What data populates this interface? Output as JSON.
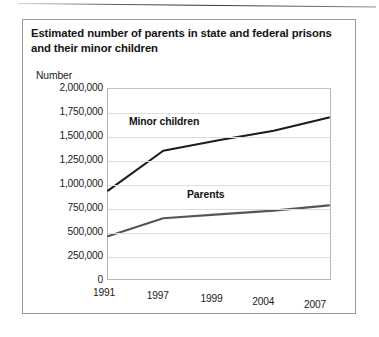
{
  "figure": {
    "title": "Estimated number of parents in state and federal prisons and their minor children"
  },
  "chart_data": {
    "type": "line",
    "title": "Estimated number of parents in state and federal prisons and their minor children",
    "xlabel": "",
    "ylabel": "Number",
    "ylim": [
      0,
      2000000
    ],
    "grid": true,
    "legend": "inline-labels",
    "categories": [
      "1991",
      "1997",
      "1999",
      "2004",
      "2007"
    ],
    "ytick_labels": [
      "2,000,000",
      "1,750,000",
      "1,500,000",
      "1,250,000",
      "1,000,000",
      "750,000",
      "500,000",
      "250,000",
      "0"
    ],
    "ytick_values": [
      2000000,
      1750000,
      1500000,
      1250000,
      1000000,
      750000,
      500000,
      250000,
      0
    ],
    "series": [
      {
        "name": "Minor children",
        "color": "#1c1c1c",
        "values": [
          930000,
          1350000,
          1460000,
          1560000,
          1700000
        ]
      },
      {
        "name": "Parents",
        "color": "#565656",
        "values": [
          450000,
          640000,
          680000,
          720000,
          775000
        ]
      }
    ],
    "annotations": [
      {
        "text": "Minor children",
        "series": "Minor children"
      },
      {
        "text": "Parents",
        "series": "Parents"
      }
    ]
  }
}
